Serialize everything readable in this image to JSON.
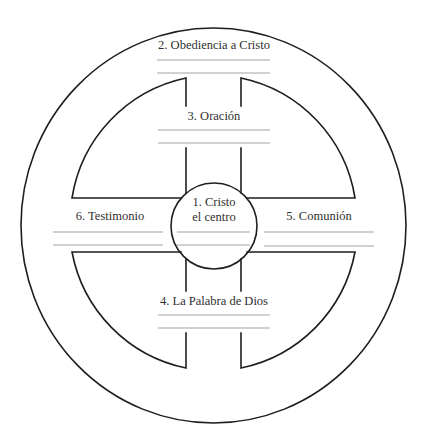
{
  "diagram": {
    "type": "wheel-diagram",
    "center": {
      "label_line1": "1. Cristo",
      "label_line2": "el centro"
    },
    "sections": [
      {
        "id": "top",
        "label": "2. Obediencia a Cristo"
      },
      {
        "id": "upper-spoke",
        "label": "3. Oración"
      },
      {
        "id": "lower-spoke",
        "label": "4. La Palabra de Dios"
      },
      {
        "id": "right-spoke",
        "label": "5. Comunión"
      },
      {
        "id": "left-spoke",
        "label": "6. Testimonio"
      }
    ],
    "blank_lines_per_section": 2,
    "colors": {
      "stroke": "#1e1e1e",
      "write_line": "#a3a3a3",
      "text": "#2f2f2f",
      "background": "#ffffff"
    }
  }
}
